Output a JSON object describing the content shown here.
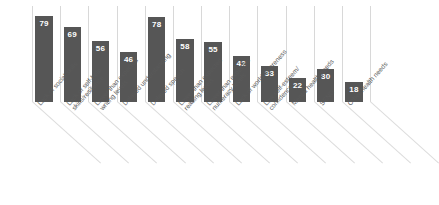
{
  "chart_data": {
    "type": "bar",
    "title": "",
    "subtitle": "",
    "xlabel": "",
    "ylabel": "",
    "ylim": [
      0,
      88
    ],
    "grid": "vertical-category-separators",
    "legend": "none",
    "orientation": "vertical",
    "bar_color": "#565656",
    "value_label_color": "#ffffff",
    "gridline_color": "#d8d8d8",
    "background_color": "#ffffff",
    "label_rotation_deg": -48,
    "categories": [
      "Lack of social skills",
      "Lack of self-help skills/resilience",
      "Lower than expected writing levels",
      "Delayed understanding",
      "Delayed speech",
      "Lower than expected reading levels",
      "Lower than expected numeracy levels",
      "Lack of world awareness",
      "Low self-esteem/confidence",
      "Mental health needs",
      "SEND",
      "Other health needs"
    ],
    "category_lines": [
      [
        "Lack of social skills",
        ""
      ],
      [
        "Lack of self-help",
        "skills/resilience"
      ],
      [
        "Lower than expected",
        "writing levels"
      ],
      [
        "Delayed understanding",
        ""
      ],
      [
        "Delayed speech",
        ""
      ],
      [
        "Lower than expected",
        "reading levels"
      ],
      [
        "Lower than expected",
        "numeracy levels"
      ],
      [
        "Lack of world awareness",
        ""
      ],
      [
        "Low self-esteem/",
        "confidence"
      ],
      [
        "Mental health needs",
        ""
      ],
      [
        "SEND",
        ""
      ],
      [
        "Other health needs",
        ""
      ]
    ],
    "values": [
      79,
      69,
      56,
      46,
      78,
      58,
      55,
      42,
      33,
      22,
      30,
      18
    ]
  }
}
